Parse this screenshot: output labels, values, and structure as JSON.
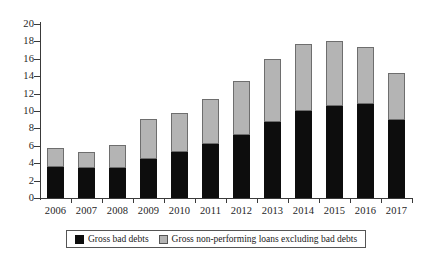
{
  "chart_data": {
    "type": "bar",
    "stacked": true,
    "title": "",
    "subtitle": "",
    "xlabel": "",
    "ylabel": "",
    "categories": [
      "2006",
      "2007",
      "2008",
      "2009",
      "2010",
      "2011",
      "2012",
      "2013",
      "2014",
      "2015",
      "2016",
      "2017"
    ],
    "series": [
      {
        "name": "Gross bad debts",
        "color": "#0d0d0d",
        "values": [
          3.6,
          3.4,
          3.5,
          4.5,
          5.3,
          6.2,
          7.2,
          8.7,
          10.0,
          10.6,
          10.8,
          9.0
        ]
      },
      {
        "name": "Gross non-performing loans excluding bad debts",
        "color": "#b4b4b4",
        "values": [
          2.2,
          1.9,
          2.6,
          4.6,
          4.5,
          5.2,
          6.3,
          7.3,
          7.7,
          7.5,
          6.6,
          5.4
        ]
      }
    ],
    "totals": [
      5.8,
      5.3,
      6.1,
      9.1,
      9.8,
      11.4,
      13.5,
      16.0,
      17.7,
      18.1,
      17.4,
      14.4
    ],
    "ylim": [
      0,
      20
    ],
    "ytick_step": 2,
    "yticks": [
      "0",
      "2",
      "4",
      "6",
      "8",
      "10",
      "12",
      "14",
      "16",
      "18",
      "20"
    ],
    "grid": false,
    "legend_position": "bottom"
  },
  "legend": {
    "items": [
      {
        "label": "Gross bad debts",
        "swatch": "black-swatch-icon"
      },
      {
        "label": "Gross non-performing loans excluding bad debts",
        "swatch": "gray-swatch-icon"
      }
    ]
  }
}
